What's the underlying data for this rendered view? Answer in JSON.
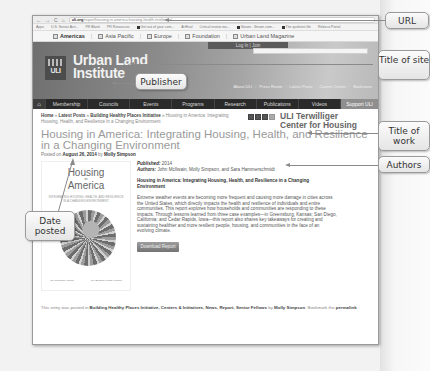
{
  "browser": {
    "url_domain": "uli.org",
    "url_path": "/report/housing-in-america-housing-health-resilience/",
    "bookmarks": [
      "Apps",
      "U.S. Senior Acti...",
      "PR Blank",
      "PR Resources",
      "Get out of your com...",
      "ArtEval",
      "Critical review wa...",
      "Steam - Steam com...",
      "The quirkiest life",
      "Rebeco Portal",
      "Curated Hashtag In...",
      "Analytics - Steam C..."
    ]
  },
  "region_tabs": [
    "Americas",
    "Asia Pacific",
    "Europe",
    "Foundation",
    "Urban Land Magazine"
  ],
  "banner": {
    "login_label": "Log In",
    "join_label": "Join",
    "logo_text": "ULI",
    "site_name_line1": "Urban Land",
    "site_name_line2": "Institute",
    "utility_links": [
      "About ULI",
      "Press Room",
      "Latest Posts",
      "Career Center",
      "Bookstore"
    ]
  },
  "main_nav": [
    "Membership",
    "Councils",
    "Events",
    "Programs",
    "Research",
    "Publications",
    "Videos",
    "Support ULI"
  ],
  "breadcrumb": {
    "items": [
      "Home",
      "Latest Posts",
      "Building Healthy Places Initiative"
    ],
    "current": "Housing in America: Integrating Housing, Health, and Resilience in a Changing Environment"
  },
  "sidebar": {
    "center_name_line1": "ULI Terwilliger",
    "center_name_line2": "Center for Housing"
  },
  "article": {
    "title": "Housing in America: Integrating Housing, Health, and Resilience in a Changing Environment",
    "posted_prefix": "Posted on",
    "posted_date": "August 26, 2014",
    "posted_by": "by",
    "posted_author": "Molly Simpson",
    "published_label": "Published:",
    "published_value": "2014",
    "authors_label": "Authors:",
    "authors_value": "John McIlwain, Molly Simpson, and Sara Hammerschmidt",
    "subtitle": "Housing in America: Integrating Housing, Health, and Resilience in a Changing Environment",
    "description": "Extreme weather events are becoming more frequent and causing more damage in cities across the United States, which directly impacts the health and resilience of individuals and entire communities. This report explores how households and communities are responding to these impacts. Through lessons learned from three case examples—in Greensburg, Kansas; San Diego, California; and Cedar Rapids, Iowa—this report also shares key takeaways for creating and sustaining healthier and more resilient people, housing, and communities in the face of an evolving climate.",
    "download_label": "Download Report",
    "cover": {
      "title_line1": "Housing",
      "title_in": "in",
      "title_line2": "America",
      "subtitle": "INTEGRATING HOUSING, HEALTH, AND RESILIENCE IN A CHANGING ENVIRONMENT",
      "logo_left": "ULI Terwilliger Center",
      "logo_right": "ULI Building Healthy Places"
    }
  },
  "footer": {
    "prefix": "This entry was posted in",
    "categories": "Building Healthy Places Initiative, Centers & Initiatives, News, Report, Senior Fellows",
    "by": "by",
    "author": "Molly Simpson",
    "bookmark_text": ". Bookmark the",
    "permalink": "permalink",
    "end": "."
  },
  "callouts": {
    "url": "URL",
    "site_title": "Title of site",
    "publisher": "Publisher",
    "work_title": "Title of work",
    "authors": "Authors",
    "date_posted": "Date posted"
  }
}
